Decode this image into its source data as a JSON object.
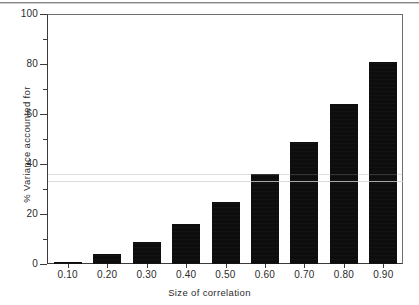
{
  "chart_data": {
    "type": "bar",
    "title": "",
    "xlabel": "Size of correlation",
    "ylabel": "% Variance accounted for",
    "categories": [
      "0.10",
      "0.20",
      "0.30",
      "0.40",
      "0.50",
      "0.60",
      "0.70",
      "0.80",
      "0.90"
    ],
    "values": [
      1,
      4,
      9,
      16,
      25,
      36,
      49,
      64,
      81
    ],
    "series": [
      {
        "name": "% Variance accounted for",
        "values": [
          1,
          4,
          9,
          16,
          25,
          36,
          49,
          64,
          81
        ]
      }
    ],
    "ylim": [
      0,
      100
    ],
    "y_major_ticks": [
      0,
      20,
      40,
      60,
      80,
      100
    ],
    "y_minor_ticks": [
      10,
      30,
      50,
      70,
      90
    ],
    "y_tick_labels": [
      "0",
      "20",
      "40",
      "60",
      "80",
      "100"
    ],
    "x_tick_labels": [
      "0.10",
      "0.20",
      "0.30",
      "0.40",
      "0.50",
      "0.60",
      "0.70",
      "0.80",
      "0.90"
    ],
    "grid": false,
    "legend": null,
    "legend_position": "none",
    "bar_color": "#0d0d0d",
    "background_color": "#ffffff",
    "axis_color": "#3b3b3b",
    "annotations": []
  },
  "figure": {
    "y_axis_label": "% Variance accounted for",
    "x_axis_label": "Size of correlation",
    "y_labels": [
      "100",
      "80",
      "60",
      "40",
      "20",
      "0"
    ],
    "x_labels": [
      "0.10",
      "0.20",
      "0.30",
      "0.40",
      "0.50",
      "0.60",
      "0.70",
      "0.80",
      "0.90"
    ],
    "bar_values": [
      "1",
      "4",
      "9",
      "16",
      "25",
      "36",
      "49",
      "64",
      "81"
    ]
  }
}
